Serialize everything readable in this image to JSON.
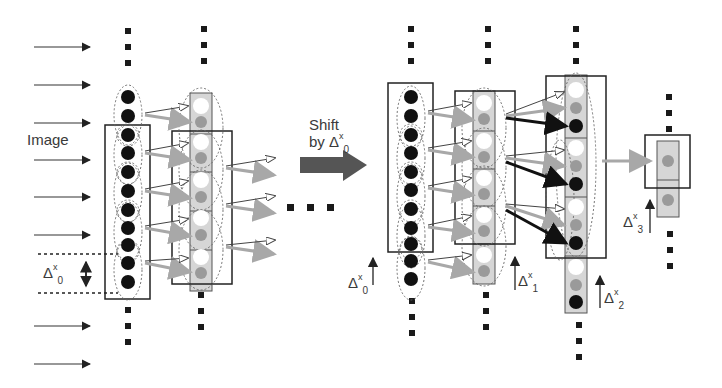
{
  "labels": {
    "image": "Image",
    "shift_line1": "Shift",
    "shift_line2_prefix": "by Δ",
    "delta_symbol": "Δ",
    "x_superscript": "x",
    "delta_x0_sub": "0",
    "delta_x1_sub": "1",
    "delta_x2_sub": "2",
    "delta_x3_sub": "3"
  },
  "colors": {
    "dark_neuron": "#111111",
    "gray_neuron": "#9a9a9a",
    "white_neuron": "#ffffff",
    "column_fill": "#d6d6d6",
    "frame": "#222222",
    "shift_arrow": "#555555",
    "gray_arrow": "#a8a8a8",
    "dark_arrow": "#1a1a1a"
  },
  "left_panel": {
    "input_arrows": 10,
    "layer0_neurons": 12,
    "layer1_units": 4,
    "output_arrow_pairs": 3
  },
  "right_panel": {
    "layer0_neurons": 12,
    "layer1_units": 4,
    "layer2_units": 4,
    "layer3_units": 2
  }
}
